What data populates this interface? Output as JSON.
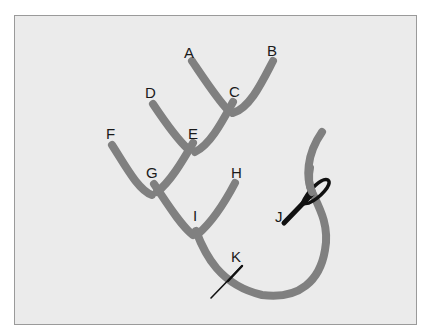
{
  "diagram": {
    "colors": {
      "background": "#ebebeb",
      "frame_border": "#9a9a9a",
      "thread": "#808080",
      "needle": "#111111",
      "label": "#1a1a1a"
    },
    "labels": {
      "A": "A",
      "B": "B",
      "C": "C",
      "D": "D",
      "E": "E",
      "F": "F",
      "G": "G",
      "H": "H",
      "I": "I",
      "J": "J",
      "K": "K"
    }
  }
}
